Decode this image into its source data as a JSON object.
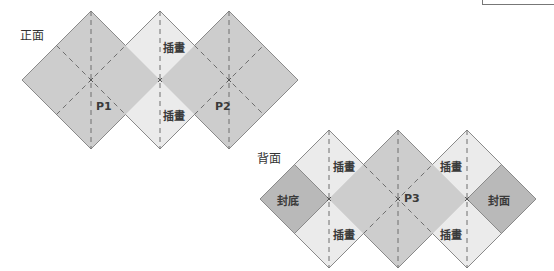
{
  "colors": {
    "main": "#cdcdcd",
    "light": "#ebebeb",
    "cover": "#b9b9b9",
    "outline": "#8a8a8a",
    "fold": "#6f6f6f"
  },
  "front": {
    "title": "正面",
    "labels": {
      "p1": "P1",
      "p2": "P2",
      "insert_top": "插畫",
      "insert_bottom": "插畫"
    }
  },
  "back": {
    "title": "背面",
    "labels": {
      "p3": "P3",
      "back_cover": "封底",
      "front_cover": "封面",
      "insert_left_top": "插畫",
      "insert_left_bottom": "插畫",
      "insert_right_top": "插畫",
      "insert_right_bottom": "插畫"
    }
  }
}
